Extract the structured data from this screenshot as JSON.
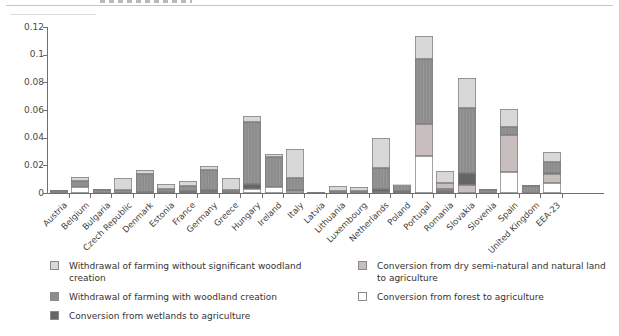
{
  "chart_data": {
    "type": "bar",
    "subtype": "stacked-vertical",
    "title": "",
    "xlabel": "",
    "ylabel": "",
    "ylim": [
      0,
      0.12
    ],
    "grid": false,
    "ytick_labels": [
      "0",
      "0.02",
      "0.04",
      "0.06",
      "0.08",
      "0.1",
      "0.12"
    ],
    "ytick_values": [
      0,
      0.02,
      0.04,
      0.06,
      0.08,
      0.1,
      0.12
    ],
    "colors": {
      "without": "#d8d8d8",
      "with": "#8d8d8d",
      "wetlands": "#656565",
      "dry": "#c9bebe",
      "forest": "#ffffff"
    },
    "legend_position": "bottom",
    "legend": [
      {
        "key": "without",
        "column": 0,
        "label": "Withdrawal of farming without significant woodland creation"
      },
      {
        "key": "with",
        "column": 0,
        "label": "Withdrawal of farming with woodland creation"
      },
      {
        "key": "wetlands",
        "column": 0,
        "label": "Conversion from wetlands to agriculture"
      },
      {
        "key": "dry",
        "column": 1,
        "label": "Conversion from dry semi-natural and natural land to agriculture"
      },
      {
        "key": "forest",
        "column": 1,
        "label": "Conversion from forest to agriculture"
      }
    ],
    "categories": [
      "Austria",
      "Belgium",
      "Bulgaria",
      "Czech Republic",
      "Denmark",
      "Estonia",
      "France",
      "Germany",
      "Greece",
      "Hungary",
      "Ireland",
      "Italy",
      "Latvia",
      "Lithuania",
      "Luxembourg",
      "Netherlands",
      "Poland",
      "Portugal",
      "Romania",
      "Slovakia",
      "Slovenia",
      "Spain",
      "United Kingdom",
      "EEA-23"
    ],
    "bars": [
      {
        "country": "Austria",
        "segments": [
          {
            "cat": "with",
            "v": 0.0018
          },
          {
            "cat": "without",
            "v": 0.0007
          }
        ]
      },
      {
        "country": "Belgium",
        "segments": [
          {
            "cat": "forest",
            "v": 0.004
          },
          {
            "cat": "with",
            "v": 0.005
          },
          {
            "cat": "without",
            "v": 0.0025
          }
        ]
      },
      {
        "country": "Bulgaria",
        "segments": [
          {
            "cat": "with",
            "v": 0.002
          },
          {
            "cat": "without",
            "v": 0.0008
          }
        ]
      },
      {
        "country": "Czech Republic",
        "segments": [
          {
            "cat": "with",
            "v": 0.0025
          },
          {
            "cat": "without",
            "v": 0.0085
          }
        ]
      },
      {
        "country": "Denmark",
        "segments": [
          {
            "cat": "wetlands",
            "v": 0.001
          },
          {
            "cat": "with",
            "v": 0.013
          },
          {
            "cat": "without",
            "v": 0.0028
          }
        ]
      },
      {
        "country": "Estonia",
        "segments": [
          {
            "cat": "wetlands",
            "v": 0.0008
          },
          {
            "cat": "with",
            "v": 0.0022
          },
          {
            "cat": "without",
            "v": 0.0035
          }
        ]
      },
      {
        "country": "France",
        "segments": [
          {
            "cat": "wetlands",
            "v": 0.0014
          },
          {
            "cat": "with",
            "v": 0.0036
          },
          {
            "cat": "without",
            "v": 0.0034
          }
        ]
      },
      {
        "country": "Germany",
        "segments": [
          {
            "cat": "forest",
            "v": 0.0008
          },
          {
            "cat": "wetlands",
            "v": 0.0012
          },
          {
            "cat": "with",
            "v": 0.0147
          },
          {
            "cat": "without",
            "v": 0.003
          }
        ]
      },
      {
        "country": "Greece",
        "segments": [
          {
            "cat": "forest",
            "v": 0.001
          },
          {
            "cat": "with",
            "v": 0.0014
          },
          {
            "cat": "without",
            "v": 0.0087
          }
        ]
      },
      {
        "country": "Hungary",
        "segments": [
          {
            "cat": "forest",
            "v": 0.0027
          },
          {
            "cat": "wetlands",
            "v": 0.0038
          },
          {
            "cat": "with",
            "v": 0.045
          },
          {
            "cat": "without",
            "v": 0.0043
          }
        ]
      },
      {
        "country": "Ireland",
        "segments": [
          {
            "cat": "forest",
            "v": 0.0045
          },
          {
            "cat": "with",
            "v": 0.0215
          },
          {
            "cat": "without",
            "v": 0.0022
          }
        ]
      },
      {
        "country": "Italy",
        "segments": [
          {
            "cat": "forest",
            "v": 0.0013
          },
          {
            "cat": "wetlands",
            "v": 0.0012
          },
          {
            "cat": "with",
            "v": 0.0085
          },
          {
            "cat": "without",
            "v": 0.0205
          }
        ]
      },
      {
        "country": "Latvia",
        "segments": [
          {
            "cat": "with",
            "v": 0.0006
          }
        ]
      },
      {
        "country": "Lithuania",
        "segments": [
          {
            "cat": "with",
            "v": 0.0018
          },
          {
            "cat": "without",
            "v": 0.003
          }
        ]
      },
      {
        "country": "Luxembourg",
        "segments": [
          {
            "cat": "with",
            "v": 0.0016
          },
          {
            "cat": "without",
            "v": 0.0026
          }
        ]
      },
      {
        "country": "Netherlands",
        "segments": [
          {
            "cat": "forest",
            "v": 0.0008
          },
          {
            "cat": "wetlands",
            "v": 0.0024
          },
          {
            "cat": "with",
            "v": 0.0151
          },
          {
            "cat": "without",
            "v": 0.0215
          }
        ]
      },
      {
        "country": "Poland",
        "segments": [
          {
            "cat": "wetlands",
            "v": 0.0012
          },
          {
            "cat": "with",
            "v": 0.005
          },
          {
            "cat": "without",
            "v": 0.0005
          }
        ]
      },
      {
        "country": "Portugal",
        "segments": [
          {
            "cat": "forest",
            "v": 0.0265
          },
          {
            "cat": "dry",
            "v": 0.0235
          },
          {
            "cat": "with",
            "v": 0.047
          },
          {
            "cat": "without",
            "v": 0.0165
          }
        ]
      },
      {
        "country": "Romania",
        "segments": [
          {
            "cat": "wetlands",
            "v": 0.0014
          },
          {
            "cat": "with",
            "v": 0.0012
          },
          {
            "cat": "dry",
            "v": 0.0048
          },
          {
            "cat": "without",
            "v": 0.0086
          }
        ]
      },
      {
        "country": "Slovakia",
        "segments": [
          {
            "cat": "dry",
            "v": 0.0058
          },
          {
            "cat": "wetlands",
            "v": 0.0085
          },
          {
            "cat": "with",
            "v": 0.0475
          },
          {
            "cat": "without",
            "v": 0.0217
          }
        ]
      },
      {
        "country": "Slovenia",
        "segments": [
          {
            "cat": "with",
            "v": 0.0024
          },
          {
            "cat": "without",
            "v": 0.0005
          }
        ]
      },
      {
        "country": "Spain",
        "segments": [
          {
            "cat": "forest",
            "v": 0.0155
          },
          {
            "cat": "dry",
            "v": 0.0265
          },
          {
            "cat": "with",
            "v": 0.006
          },
          {
            "cat": "without",
            "v": 0.0125
          }
        ]
      },
      {
        "country": "United Kingdom",
        "segments": [
          {
            "cat": "with",
            "v": 0.005
          },
          {
            "cat": "without",
            "v": 0.0005
          }
        ]
      },
      {
        "country": "EEA-23",
        "segments": [
          {
            "cat": "forest",
            "v": 0.007
          },
          {
            "cat": "dry",
            "v": 0.0065
          },
          {
            "cat": "wetlands",
            "v": 0.001
          },
          {
            "cat": "with",
            "v": 0.008
          },
          {
            "cat": "without",
            "v": 0.0075
          }
        ]
      }
    ]
  }
}
